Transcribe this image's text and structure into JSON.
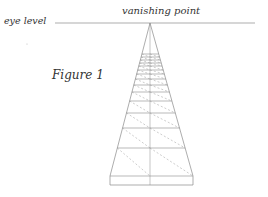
{
  "labels": {
    "eye_level": "eye level",
    "vanishing_point": "vanishing point",
    "figure": "Figure 1"
  },
  "geometry": {
    "horizon_y": 23,
    "horizon_x1": 55,
    "horizon_x2": 255,
    "vp_x": 150,
    "vp_y": 23,
    "base_y": 176,
    "base_left": 110,
    "base_right": 193,
    "slab_bottom": 185,
    "row_lines_y": [
      54,
      57,
      60,
      63,
      66,
      70,
      74,
      79,
      85,
      92,
      101,
      113,
      128,
      148,
      176
    ]
  },
  "colors": {
    "line": "#8a8a8a",
    "dash": "#9a9a9a",
    "text": "#333333"
  }
}
